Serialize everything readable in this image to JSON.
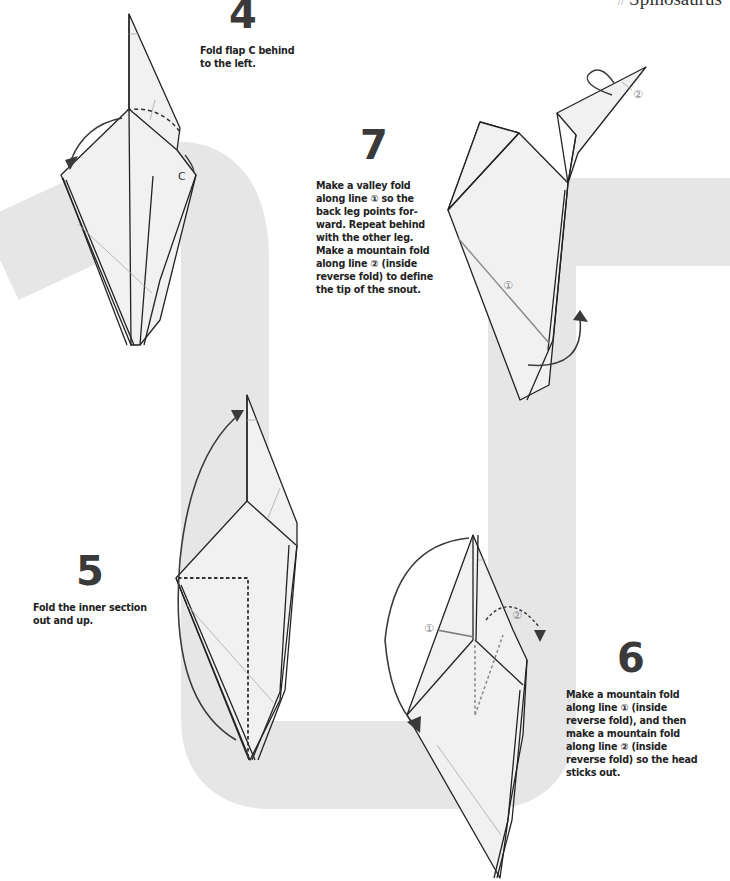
{
  "header": {
    "title": "Spinosaurus",
    "prefix": "//"
  },
  "steps": [
    {
      "number": "4",
      "lines": [
        "Fold flap C behind",
        "to the left."
      ],
      "labels": [
        "C"
      ]
    },
    {
      "number": "5",
      "lines": [
        "Fold the inner section",
        "out and up."
      ]
    },
    {
      "number": "6",
      "lines": [
        "Make a mountain fold",
        "along line ① (inside",
        "reverse fold), and then",
        "make a mountain fold",
        "along line ② (inside",
        "reverse fold) so the head",
        "sticks out."
      ],
      "labels": [
        "①",
        "②"
      ]
    },
    {
      "number": "7",
      "lines": [
        "Make a valley fold",
        "along line ① so the",
        "back leg points for-",
        "ward. Repeat behind",
        "with the other leg.",
        "Make a mountain fold",
        "along line ② (inside",
        "reverse fold) to define",
        "the tip of the snout."
      ],
      "labels": [
        "①",
        "②"
      ]
    }
  ],
  "colors": {
    "band": "#e6e6e6",
    "paper": "#f1f1f1",
    "line": "#222222",
    "crease": "#9a9a9a",
    "arrow": "#3a3a3a"
  }
}
